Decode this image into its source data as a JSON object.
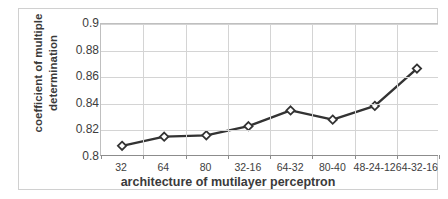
{
  "chart_data": {
    "type": "line",
    "title": "",
    "xlabel": "architecture of mutilayer perceptron",
    "ylabel": "coefficient of multiple determination",
    "ylabel_lines": [
      "coefficient of multiple",
      "determination"
    ],
    "categories": [
      "32",
      "64",
      "80",
      "32-16",
      "64-32",
      "80-40",
      "48-24-12",
      "64-32-16"
    ],
    "values": [
      0.807,
      0.814,
      0.815,
      0.822,
      0.834,
      0.827,
      0.8375,
      0.866
    ],
    "ylim": [
      0.8,
      0.9
    ],
    "ytick_labels": [
      "0.9",
      "0.88",
      "0.86",
      "0.84",
      "0.82",
      "0.8"
    ],
    "ytick_values": [
      0.9,
      0.88,
      0.86,
      0.84,
      0.82,
      0.8
    ],
    "grid": true,
    "legend": false,
    "marker": "diamond",
    "series_color": "#333333",
    "marker_fill": "#ffffff",
    "grid_color": "#d4d4d4",
    "frame_color": "#d0d0d0"
  }
}
